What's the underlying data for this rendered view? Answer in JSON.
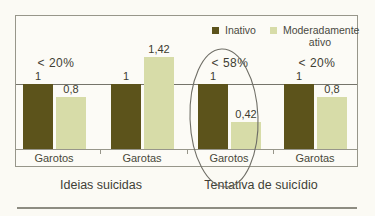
{
  "chart_data": {
    "type": "bar",
    "categories": [
      "Garotos",
      "Garotas",
      "Garotos",
      "Garotas"
    ],
    "sections": [
      {
        "label": "Ideias suicidas",
        "groups": [
          0,
          1
        ]
      },
      {
        "label": "Tentativa de suicídio",
        "groups": [
          2,
          3
        ]
      }
    ],
    "series": [
      {
        "name": "Inativo",
        "color": "#5c531b",
        "values": [
          1,
          1,
          1,
          1
        ],
        "labels": [
          "1",
          "1",
          "1",
          "1"
        ]
      },
      {
        "name": "Moderadamente ativo",
        "color": "#d7dca8",
        "values": [
          0.8,
          1.42,
          0.42,
          0.8
        ],
        "labels": [
          "0,8",
          "1,42",
          "0,42",
          "0,8"
        ]
      }
    ],
    "annotations": [
      {
        "group": 0,
        "text": "< 20%"
      },
      {
        "group": 2,
        "text": "< 58%"
      },
      {
        "group": 3,
        "text": "< 20%"
      }
    ],
    "reference_line_value": 1,
    "ylim": [
      0,
      1.93
    ],
    "grid": false,
    "legend_position": "top-right",
    "circled_group": 2,
    "circled_section": "Tentativa de suicídio"
  }
}
